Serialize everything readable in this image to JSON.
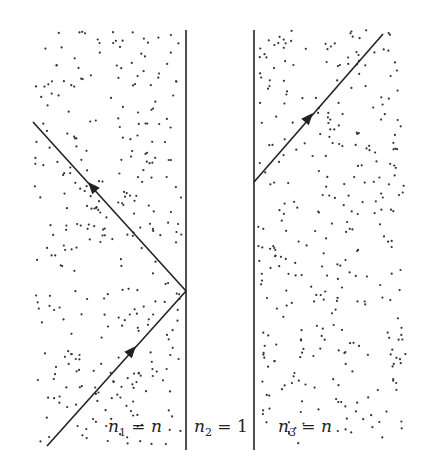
{
  "diagram": {
    "title": "",
    "media": [
      {
        "id": "n1",
        "symbol": "n",
        "index": "1",
        "value": "n",
        "label_text": "n1 = n"
      },
      {
        "id": "n2",
        "symbol": "n",
        "index": "2",
        "value": "1",
        "label_text": "n2 = 1"
      },
      {
        "id": "n3",
        "symbol": "n",
        "index": "3",
        "value": "n",
        "label_text": "n3 = n"
      }
    ],
    "rays": [
      {
        "name": "incident-ray",
        "from": [
          47,
          446
        ],
        "to": [
          186,
          291
        ],
        "arrow_at": [
          128,
          355
        ]
      },
      {
        "name": "reflected-ray",
        "from": [
          186,
          291
        ],
        "to": [
          33,
          122
        ],
        "arrow_at": [
          95,
          190
        ]
      },
      {
        "name": "frustrated-transmitted-ray",
        "from": [
          254,
          182
        ],
        "to": [
          383,
          34
        ],
        "arrow_at": [
          307,
          121
        ]
      }
    ],
    "interfaces": [
      {
        "name": "interface-1-2",
        "x": 186,
        "y1": 30,
        "y2": 450
      },
      {
        "name": "interface-2-3",
        "x": 254,
        "y1": 30,
        "y2": 450
      }
    ],
    "colors": {
      "line": "#222222",
      "dots": "#333333",
      "background": "#ffffff"
    }
  }
}
